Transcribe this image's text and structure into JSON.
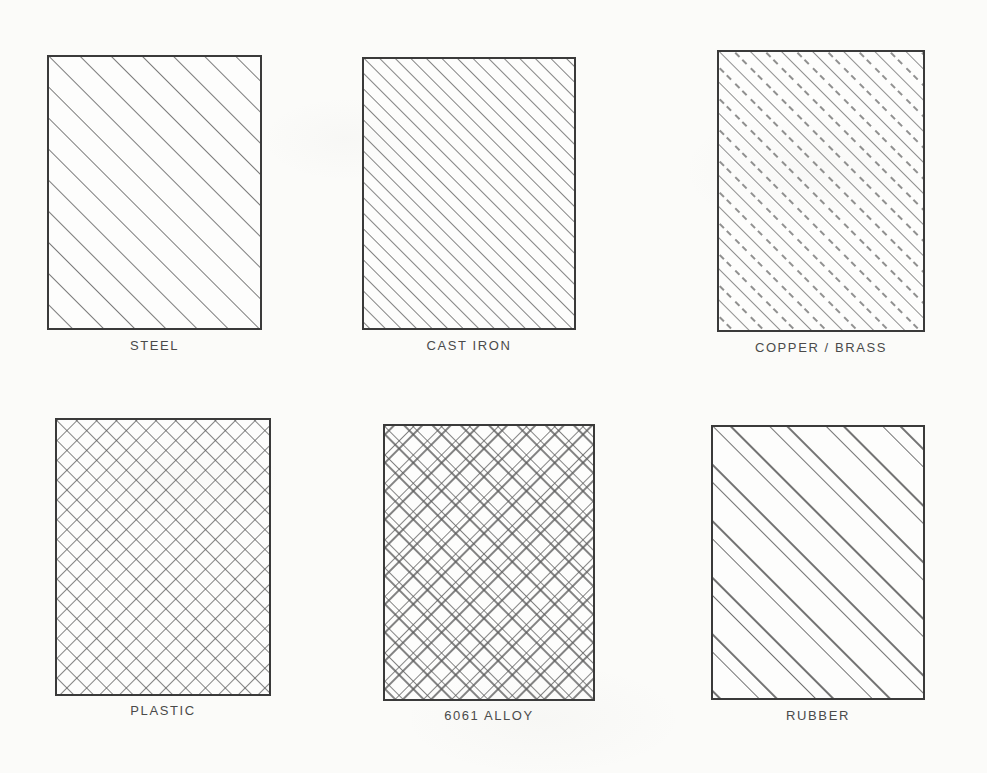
{
  "sheet": {
    "title": "Material Hatch Pattern Chart",
    "background_color": "#fbfbf9",
    "line_color": "#3a3a3a",
    "text_color": "#4a4a4a"
  },
  "swatches": [
    {
      "id": "steel",
      "label": "STEEL",
      "pattern": "diagonal-hatch-wide",
      "hatch_angle_deg": 45,
      "hatch_spacing_px": 22,
      "x": 47,
      "y": 55,
      "width": 215,
      "height": 275,
      "caption_y": 338
    },
    {
      "id": "cast-iron",
      "label": "CAST IRON",
      "pattern": "diagonal-hatch-tight",
      "hatch_angle_deg": 45,
      "hatch_spacing_px": 11,
      "x": 362,
      "y": 57,
      "width": 214,
      "height": 273,
      "caption_y": 338
    },
    {
      "id": "copper-brass",
      "label": "COPPER / BRASS",
      "pattern": "diagonal-alternating-dashed",
      "hatch_angle_deg": 45,
      "hatch_spacing_px": 11,
      "x": 717,
      "y": 50,
      "width": 208,
      "height": 282,
      "caption_y": 340
    },
    {
      "id": "plastic",
      "label": "PLASTIC",
      "pattern": "cross-hatch",
      "hatch_angle_deg": 45,
      "hatch_spacing_px": 14,
      "x": 55,
      "y": 418,
      "width": 216,
      "height": 278,
      "caption_y": 703
    },
    {
      "id": "alloy-6061",
      "label": "6061 ALLOY",
      "pattern": "double-cross-hatch-weave",
      "hatch_angle_deg": 45,
      "hatch_spacing_px": 20,
      "x": 383,
      "y": 424,
      "width": 212,
      "height": 277,
      "caption_y": 708
    },
    {
      "id": "rubber",
      "label": "RUBBER",
      "pattern": "diagonal-paired-lines",
      "hatch_angle_deg": 45,
      "hatch_spacing_px": 40,
      "x": 711,
      "y": 425,
      "width": 214,
      "height": 275,
      "caption_y": 708
    }
  ]
}
